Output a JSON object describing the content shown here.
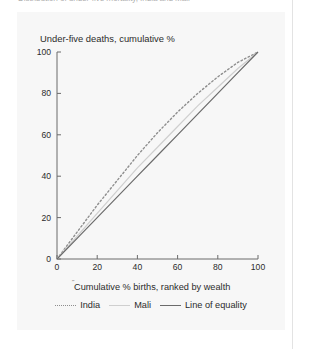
{
  "document": {
    "partial_heading": "Distribution of under-five mortality, India and Mali"
  },
  "figure": {
    "y_axis_title": "Under-five deaths, cumulative %",
    "x_axis_title": "Cumulative % births, ranked by wealth",
    "x_axis_title_marker": "˝"
  },
  "legend": {
    "items": [
      {
        "label": "India",
        "style": "dashed",
        "color": "#8e8e8e"
      },
      {
        "label": "Mali",
        "style": "solid",
        "color": "#cfcfcf"
      },
      {
        "label": "Line of equality",
        "style": "solid",
        "color": "#6b6b6b"
      }
    ]
  },
  "chart_data": {
    "type": "line",
    "title": "Distribution of under-five mortality, India and Mali",
    "xlabel": "Cumulative % births, ranked by wealth",
    "ylabel": "Under-five deaths, cumulative %",
    "xlim": [
      0,
      100
    ],
    "ylim": [
      0,
      100
    ],
    "xticks": [
      0,
      20,
      40,
      60,
      80,
      100
    ],
    "yticks": [
      0,
      20,
      40,
      60,
      80,
      100
    ],
    "grid": false,
    "legend_position": "below-axis",
    "x": [
      0,
      10,
      20,
      30,
      40,
      50,
      60,
      70,
      80,
      90,
      100
    ],
    "series": [
      {
        "name": "India",
        "style": "dashed",
        "color": "#8e8e8e",
        "values": [
          0,
          13,
          26,
          38,
          50,
          61,
          71,
          80,
          88,
          95,
          100
        ]
      },
      {
        "name": "Mali",
        "style": "solid",
        "color": "#cfcfcf",
        "values": [
          0,
          11,
          22,
          33,
          44,
          54,
          64,
          74,
          83,
          92,
          100
        ]
      },
      {
        "name": "Line of equality",
        "style": "solid",
        "color": "#6b6b6b",
        "values": [
          0,
          10,
          20,
          30,
          40,
          50,
          60,
          70,
          80,
          90,
          100
        ]
      }
    ]
  },
  "axis_ticks": {
    "y": [
      "100",
      "80",
      "60",
      "40",
      "20",
      "0"
    ],
    "x": [
      "0",
      "20",
      "40",
      "60",
      "80",
      "100"
    ]
  }
}
